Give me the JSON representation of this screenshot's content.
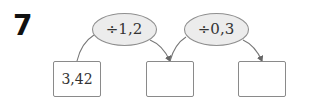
{
  "problem": {
    "number": "7"
  },
  "operations": [
    {
      "label": "÷1,2"
    },
    {
      "label": "÷0,3"
    }
  ],
  "boxes": [
    {
      "value": "3,42",
      "kind": "given"
    },
    {
      "value": "",
      "kind": "answer"
    },
    {
      "value": "",
      "kind": "answer"
    }
  ],
  "colors": {
    "ellipse_fill": "#ececec",
    "stroke": "#8a8a8a",
    "arrow": "#666666"
  }
}
